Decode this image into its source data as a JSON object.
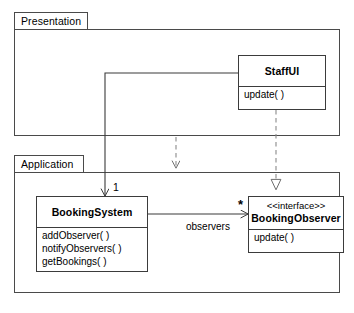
{
  "diagram": {
    "type": "uml-class-diagram",
    "stroke_color": "#3b3b3b",
    "package_stroke_color": "#4a4a4a",
    "background": "#ffffff"
  },
  "packages": [
    {
      "id": "presentation",
      "label": "Presentation"
    },
    {
      "id": "application",
      "label": "Application"
    }
  ],
  "classes": [
    {
      "id": "staffui",
      "stereotype": "",
      "name": "StaffUI",
      "operations": [
        "update( )"
      ]
    },
    {
      "id": "bookingsystem",
      "stereotype": "",
      "name": "BookingSystem",
      "operations": [
        "addObserver( )",
        "notifyObservers( )",
        "getBookings( )"
      ]
    },
    {
      "id": "bookingobserver",
      "stereotype": "<<interface>>",
      "name": "BookingObserver",
      "operations": [
        "update( )"
      ]
    }
  ],
  "relationships": [
    {
      "id": "staffui-to-bookingsystem",
      "kind": "association",
      "line": "solid",
      "arrowhead": "open",
      "source": "StaffUI",
      "target": "BookingSystem",
      "target_multiplicity": "1"
    },
    {
      "id": "presentation-to-application",
      "kind": "dependency",
      "line": "dashed",
      "arrowhead": "open",
      "source": "Presentation",
      "target": "Application"
    },
    {
      "id": "staffui-realizes-bookingobserver",
      "kind": "realization",
      "line": "dashed",
      "arrowhead": "hollow-triangle",
      "source": "StaffUI",
      "target": "BookingObserver"
    },
    {
      "id": "bookingsystem-to-bookingobserver",
      "kind": "association",
      "line": "solid",
      "arrowhead": "open",
      "source": "BookingSystem",
      "target": "BookingObserver",
      "role_name": "observers",
      "target_multiplicity": "*"
    }
  ],
  "labels": {
    "multiplicity_one": "1",
    "multiplicity_many": "*",
    "role_observers": "observers"
  }
}
